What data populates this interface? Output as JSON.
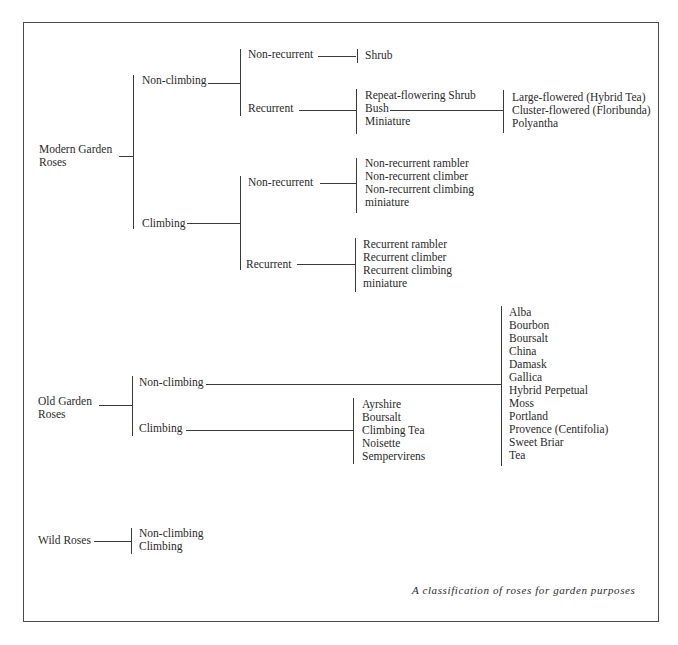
{
  "caption": "A classification of roses for garden purposes",
  "modern": {
    "label_line1": "Modern Garden",
    "label_line2": "Roses",
    "non_climbing": {
      "label": "Non-climbing",
      "non_recurrent": {
        "label": "Non-recurrent",
        "items": [
          "Shrub"
        ]
      },
      "recurrent": {
        "label": "Recurrent",
        "items": [
          "Repeat-flowering Shrub",
          "Bush",
          "Miniature"
        ],
        "bush_types": [
          "Large-flowered (Hybrid Tea)",
          "Cluster-flowered (Floribunda)",
          "Polyantha"
        ]
      }
    },
    "climbing": {
      "label": "Climbing",
      "non_recurrent": {
        "label": "Non-recurrent",
        "items": [
          "Non-recurrent rambler",
          "Non-recurrent climber",
          "Non-recurrent climbing",
          "miniature"
        ]
      },
      "recurrent": {
        "label": "Recurrent",
        "items": [
          "Recurrent rambler",
          "Recurrent climber",
          "Recurrent climbing",
          "miniature"
        ]
      }
    }
  },
  "old": {
    "label_line1": "Old Garden",
    "label_line2": "Roses",
    "non_climbing": {
      "label": "Non-climbing",
      "items": [
        "Alba",
        "Bourbon",
        "Boursalt",
        "China",
        "Damask",
        "Gallica",
        "Hybrid Perpetual",
        "Moss",
        "Portland",
        "Provence (Centifolia)",
        "Sweet Briar",
        "Tea"
      ]
    },
    "climbing": {
      "label": "Climbing",
      "items": [
        "Ayrshire",
        "Boursalt",
        "Climbing Tea",
        "Noisette",
        "Sempervirens"
      ]
    }
  },
  "wild": {
    "label": "Wild Roses",
    "items": [
      "Non-climbing",
      "Climbing"
    ]
  }
}
